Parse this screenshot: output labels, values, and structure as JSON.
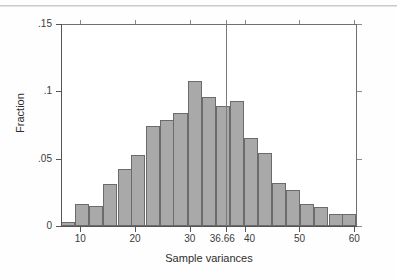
{
  "chart_data": {
    "type": "bar",
    "title": "",
    "subtitle": "",
    "xlabel": "Sample variances",
    "ylabel": "Fraction",
    "xlim": [
      6.5,
      60.5
    ],
    "ylim": [
      0,
      0.15
    ],
    "grid": false,
    "legend": null,
    "bin_width": 2.57,
    "x_tick_labels": [
      "10",
      "20",
      "30",
      "36.66",
      "40",
      "50",
      "60"
    ],
    "x_tick_values": [
      10,
      20,
      30,
      36.66,
      40,
      50,
      60
    ],
    "y_tick_labels": [
      "0",
      ".05",
      ".1",
      ".15"
    ],
    "y_tick_values": [
      0,
      0.05,
      0.1,
      0.15
    ],
    "bin_centers": [
      7.8,
      10.4,
      12.9,
      15.5,
      18.1,
      20.6,
      23.2,
      25.8,
      28.3,
      30.9,
      33.5,
      36.0,
      38.6,
      41.2,
      43.7,
      46.3,
      48.9,
      51.4,
      54.0,
      56.6,
      59.1
    ],
    "values": [
      0.003,
      0.016,
      0.015,
      0.031,
      0.042,
      0.053,
      0.074,
      0.079,
      0.084,
      0.108,
      0.096,
      0.089,
      0.093,
      0.065,
      0.054,
      0.032,
      0.027,
      0.016,
      0.014,
      0.009,
      0.009
    ],
    "annotations": [
      {
        "type": "vertical-reference-line",
        "x": 36.66,
        "y_top": 0.15,
        "label": "36.66"
      }
    ],
    "colors": {
      "bar_fill": "#a9a9a9",
      "bar_edge": "#6b6b6b",
      "axis": "#555555",
      "frame": "#6f6f6f",
      "reference_line": "#7a7a7a",
      "text": "#2e2e2e",
      "background": "#ffffff"
    }
  }
}
